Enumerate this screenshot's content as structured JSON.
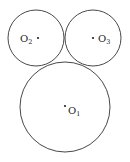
{
  "diagram": {
    "type": "tangent-circles",
    "stroke_color": "#333333",
    "circles": [
      {
        "id": "O1",
        "label": "O",
        "subscript": "1",
        "cx": 65,
        "cy": 107,
        "r": 45,
        "dot": [
          65,
          106
        ],
        "label_pos": [
          68,
          114
        ]
      },
      {
        "id": "O2",
        "label": "O",
        "subscript": "2",
        "cx": 36,
        "cy": 38,
        "r": 28,
        "dot": [
          38,
          38
        ],
        "label_pos": [
          20,
          42
        ]
      },
      {
        "id": "O3",
        "label": "O",
        "subscript": "3",
        "cx": 93,
        "cy": 38,
        "r": 28,
        "dot": [
          93,
          38
        ],
        "label_pos": [
          98,
          42
        ]
      }
    ]
  }
}
